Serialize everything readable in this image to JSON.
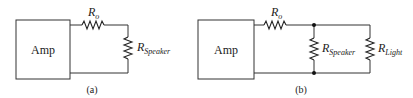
{
  "figure": {
    "panels": [
      {
        "id": "a",
        "caption": "(a)",
        "amp_label": "Amp",
        "series_resistor": {
          "symbol": "R",
          "subscript": "o"
        },
        "load_resistors": [
          {
            "symbol": "R",
            "subscript": "Speaker"
          }
        ],
        "junction_dots": 0
      },
      {
        "id": "b",
        "caption": "(b)",
        "amp_label": "Amp",
        "series_resistor": {
          "symbol": "R",
          "subscript": "o"
        },
        "load_resistors": [
          {
            "symbol": "R",
            "subscript": "Speaker"
          },
          {
            "symbol": "R",
            "subscript": "Light"
          }
        ],
        "junction_dots": 2
      }
    ],
    "colors": {
      "line": "#333333",
      "background": "#ffffff"
    }
  }
}
